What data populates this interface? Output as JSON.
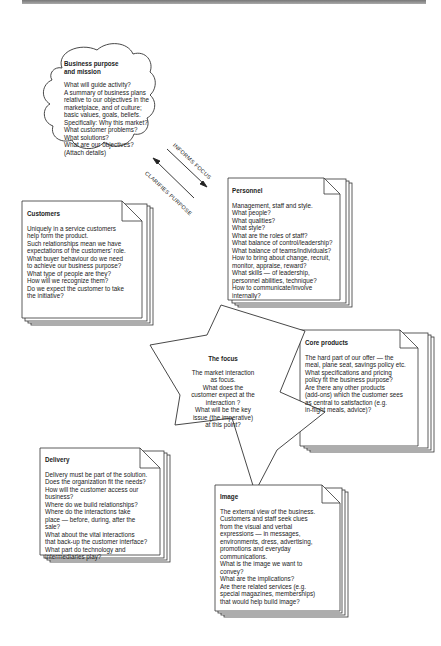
{
  "diagram": {
    "business_purpose": {
      "title_lines": [
        "Business purpose",
        "and mission"
      ],
      "lines": [
        "What will guide activity?",
        "A summary of business plans",
        "relative to our objectives in the",
        "marketplace, and of culture;",
        "basic values, goals, beliefs.",
        "Specifically: Why this market?",
        "What customer problems?",
        "What solutions?",
        "What are our objectives?",
        "(Attach details)"
      ]
    },
    "arrows": {
      "informs_focus": "INFORMS FOCUS",
      "clarifies_purpose": "CLARIFIES PURPOSE"
    },
    "personnel": {
      "title": "Personnel",
      "lines": [
        "Management, staff and style.",
        "What people?",
        "What qualities?",
        "What style?",
        "What are the roles of staff?",
        "What balance of control/leadership?",
        "What balance of teams/individuals?",
        "How to bring about change, recruit,",
        "monitor, appraise, reward?",
        "What skills — of leadership,",
        "personnel abilities, technique?",
        "How to communicate/involve",
        "internally?"
      ]
    },
    "customers": {
      "title": "Customers",
      "lines": [
        "Uniquely in a service customers",
        "help form the product.",
        "Such relationships mean we have",
        "expectations of the customers' role.",
        "What buyer behaviour do we need",
        "to achieve our business purpose?",
        "What type of people are they?",
        "How will we recognize them?",
        "Do we expect the customer to take",
        "the initiative?"
      ]
    },
    "core_products": {
      "title": "Core products",
      "lines": [
        "The hard part of our offer — the",
        "meal, plane seat, savings policy etc.",
        "What specifications and pricing",
        "policy fit the business purpose?",
        "Are there any other products",
        "(add-ons) which the customer sees",
        "as central to satisfaction (e.g.",
        "in-flight meals, advice)?"
      ]
    },
    "focus": {
      "title": "The focus",
      "lines": [
        "The market interaction",
        "as focus.",
        "What does the",
        "customer expect at the",
        "interaction ?",
        "What will be the key",
        "issue (the imperative)",
        "at this point?"
      ]
    },
    "delivery": {
      "title": "Delivery",
      "lines": [
        "Delivery must be part of the solution.",
        "Does the organization fit the needs?",
        "How will the customer access our",
        "business?",
        "Where do we build relationships?",
        "Where do the interactions take",
        "place — before, during, after the",
        "sale?",
        "What about the vital interactions",
        "that back-up the customer interface?",
        "What part do technology and",
        "intermediaries play?"
      ]
    },
    "image": {
      "title": "Image",
      "lines": [
        "The external view of the business.",
        "Customers and staff seek clues",
        "from the visual and verbal",
        "expressions — in messages,",
        "environments, dress, advertising,",
        "promotions and everyday",
        "communications.",
        "What is the image we want to",
        "convey?",
        "What are the implications?",
        "Are there related services (e.g.",
        "special magazines, memberships)",
        "that would help build image?"
      ]
    }
  }
}
